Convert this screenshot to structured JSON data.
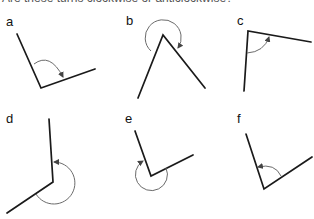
{
  "header": {
    "text": "Are these turns clockwise or anticlockwise?"
  },
  "colors": {
    "ray": "#1a1a1a",
    "arc": "#6b6b6b",
    "label": "#111111"
  },
  "panels": [
    {
      "label": "a",
      "direction": "clockwise"
    },
    {
      "label": "b",
      "direction": "clockwise"
    },
    {
      "label": "c",
      "direction": "clockwise"
    },
    {
      "label": "d",
      "direction": "anticlockwise"
    },
    {
      "label": "e",
      "direction": "clockwise"
    },
    {
      "label": "f",
      "direction": "anticlockwise"
    }
  ]
}
